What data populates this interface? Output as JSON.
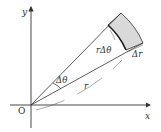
{
  "diagram": {
    "labels": {
      "origin": "O",
      "x_axis": "x",
      "y_axis": "y",
      "angle": "Δθ",
      "arc_length": "rΔθ",
      "radial_width": "Δr",
      "radius": "r"
    },
    "colors": {
      "line": "#333333",
      "shaded_region": "#d9d9d9",
      "background": "#ffffff"
    }
  }
}
